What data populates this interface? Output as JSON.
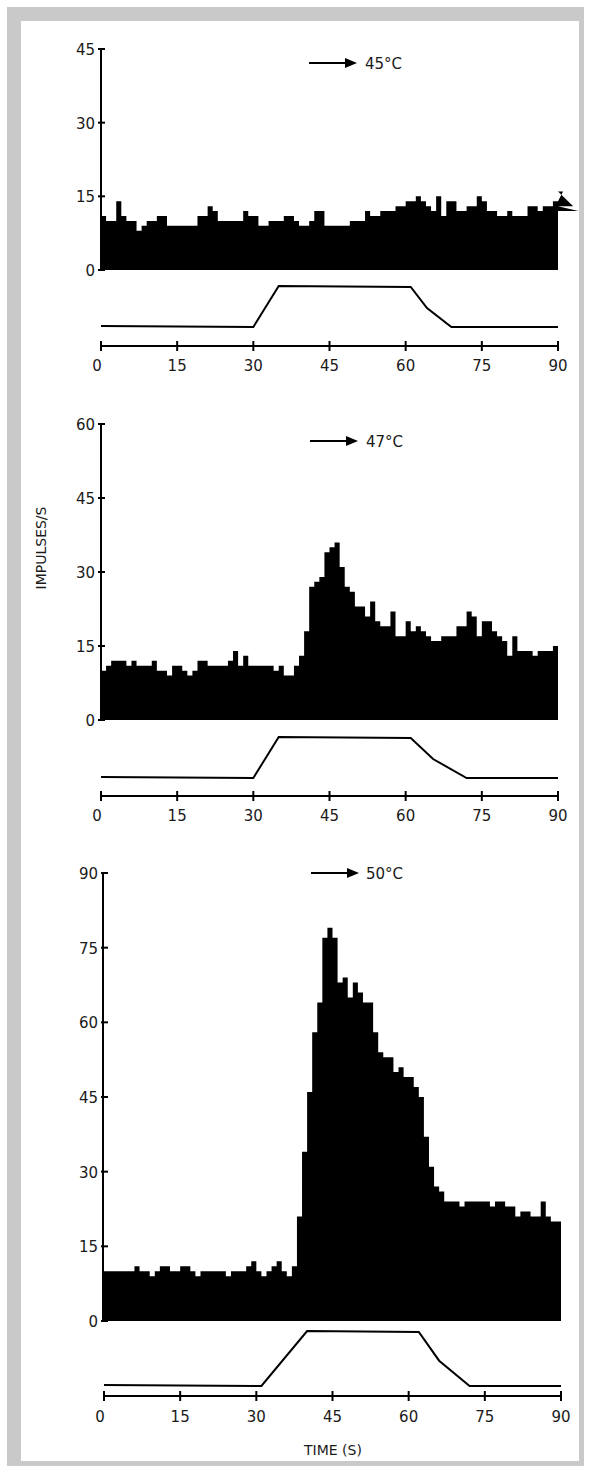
{
  "chart_data": [
    {
      "type": "bar",
      "subtype": "histogram",
      "title": "45°C",
      "stimulus_label": "45°C",
      "xlabel": "TIME (S)",
      "ylabel": "IMPULSES/S",
      "xlim": [
        0,
        90
      ],
      "ylim": [
        0,
        45
      ],
      "x_ticks": [
        0,
        15,
        30,
        45,
        60,
        75,
        90
      ],
      "y_ticks": [
        0,
        15,
        30,
        45
      ],
      "bin_width_s": 1,
      "values": [
        11,
        10,
        10,
        14,
        11,
        10,
        10,
        8,
        9,
        10,
        10,
        11,
        11,
        9,
        9,
        9,
        9,
        9,
        9,
        11,
        11,
        13,
        12,
        10,
        10,
        10,
        10,
        10,
        12,
        11,
        11,
        9,
        9,
        10,
        10,
        10,
        11,
        11,
        10,
        9,
        9,
        10,
        12,
        12,
        9,
        9,
        9,
        9,
        9,
        10,
        10,
        10,
        12,
        11,
        11,
        12,
        12,
        12,
        13,
        13,
        14,
        14,
        15,
        14,
        13,
        12,
        15,
        11,
        14,
        14,
        12,
        12,
        13,
        13,
        15,
        14,
        12,
        12,
        11,
        11,
        12,
        11,
        11,
        11,
        13,
        13,
        12,
        13,
        13,
        14,
        14,
        16,
        16,
        13,
        12
      ],
      "stimulus_trace": {
        "baseline_until_s": 30,
        "rise_end_s": 35,
        "plateau_end_s": 61,
        "fall_end_s": 69
      }
    },
    {
      "type": "bar",
      "subtype": "histogram",
      "title": "47°C",
      "stimulus_label": "47°C",
      "xlabel": "TIME (S)",
      "ylabel": "IMPULSES/S",
      "xlim": [
        0,
        90
      ],
      "ylim": [
        0,
        60
      ],
      "x_ticks": [
        0,
        15,
        30,
        45,
        60,
        75,
        90
      ],
      "y_ticks": [
        0,
        15,
        30,
        45,
        60
      ],
      "bin_width_s": 1,
      "values": [
        10,
        11,
        12,
        12,
        12,
        11,
        12,
        11,
        11,
        11,
        12,
        10,
        10,
        9,
        11,
        11,
        10,
        9,
        10,
        12,
        12,
        11,
        11,
        11,
        11,
        12,
        14,
        11,
        13,
        11,
        11,
        11,
        11,
        11,
        10,
        11,
        9,
        9,
        11,
        13,
        18,
        27,
        28,
        29,
        34,
        35,
        36,
        31,
        27,
        26,
        23,
        23,
        21,
        24,
        20,
        19,
        19,
        22,
        17,
        17,
        20,
        18,
        19,
        18,
        17,
        16,
        16,
        17,
        17,
        17,
        19,
        19,
        22,
        21,
        17,
        20,
        20,
        18,
        17,
        16,
        13,
        17,
        14,
        14,
        14,
        13,
        14,
        14,
        14,
        15,
        14
      ],
      "stimulus_trace": {
        "baseline_until_s": 30,
        "rise_end_s": 35,
        "plateau_end_s": 61,
        "fall_end_s": 72
      }
    },
    {
      "type": "bar",
      "subtype": "histogram",
      "title": "50°C",
      "stimulus_label": "50°C",
      "xlabel": "TIME (S)",
      "ylabel": "IMPULSES/S",
      "xlim": [
        0,
        90
      ],
      "ylim": [
        0,
        90
      ],
      "x_ticks": [
        0,
        15,
        30,
        45,
        60,
        75,
        90
      ],
      "y_ticks": [
        0,
        15,
        30,
        45,
        60,
        75,
        90
      ],
      "bin_width_s": 1,
      "values": [
        10,
        10,
        10,
        10,
        10,
        10,
        11,
        10,
        10,
        9,
        10,
        11,
        11,
        10,
        10,
        11,
        11,
        10,
        9,
        10,
        10,
        10,
        10,
        10,
        9,
        10,
        10,
        10,
        11,
        12,
        10,
        9,
        10,
        11,
        12,
        10,
        9,
        11,
        21,
        34,
        46,
        58,
        64,
        77,
        79,
        77,
        68,
        69,
        65,
        68,
        66,
        64,
        64,
        58,
        54,
        53,
        53,
        50,
        51,
        49,
        49,
        47,
        45,
        37,
        31,
        27,
        26,
        24,
        24,
        24,
        23,
        24,
        24,
        24,
        24,
        24,
        23,
        24,
        24,
        23,
        23,
        21,
        22,
        22,
        21,
        21,
        24,
        21,
        20,
        20,
        20
      ],
      "stimulus_trace": {
        "baseline_until_s": 31,
        "rise_end_s": 40,
        "plateau_end_s": 62,
        "fall_end_s": 72
      }
    }
  ],
  "figure": {
    "y_axis_title": "IMPULSES/S",
    "x_axis_title": "TIME (S)",
    "panels": [
      {
        "stimulus_label": "45°C",
        "y_tick_labels": [
          "0",
          "15",
          "30",
          "45"
        ],
        "x_tick_labels": [
          "0",
          "15",
          "30",
          "45",
          "60",
          "75",
          "90"
        ]
      },
      {
        "stimulus_label": "47°C",
        "y_tick_labels": [
          "0",
          "15",
          "30",
          "45",
          "60"
        ],
        "x_tick_labels": [
          "0",
          "15",
          "30",
          "45",
          "60",
          "75",
          "90"
        ]
      },
      {
        "stimulus_label": "50°C",
        "y_tick_labels": [
          "0",
          "15",
          "30",
          "45",
          "60",
          "75",
          "90"
        ],
        "x_tick_labels": [
          "0",
          "15",
          "30",
          "45",
          "60",
          "75",
          "90"
        ]
      }
    ],
    "colors": {
      "bars": "#000000",
      "frame": "#c9c9c9",
      "background": "#ffffff",
      "text": "#1a1a1a"
    }
  }
}
